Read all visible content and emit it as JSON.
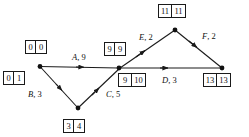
{
  "diagram": {
    "type": "activity-on-arrow-network",
    "nodes": [
      {
        "id": "start",
        "x": 40,
        "y": 66,
        "earliest": "0",
        "latest": "0",
        "box2_earliest": "0",
        "box2_latest": "1"
      },
      {
        "id": "bottom",
        "x": 78,
        "y": 108,
        "earliest": "3",
        "latest": "4"
      },
      {
        "id": "middle",
        "x": 119,
        "y": 68,
        "earliest": "9",
        "latest": "9",
        "box2_earliest": "9",
        "box2_latest": "10"
      },
      {
        "id": "apex",
        "x": 175,
        "y": 30,
        "earliest": "11",
        "latest": "11"
      },
      {
        "id": "end",
        "x": 222,
        "y": 68,
        "earliest": "13",
        "latest": "13"
      }
    ],
    "boxes": [
      {
        "name": "box-start-top",
        "first": "0",
        "second": "0",
        "x": 25,
        "y": 40,
        "wide": false
      },
      {
        "name": "box-start-bottom",
        "first": "0",
        "second": "1",
        "x": 3,
        "y": 71,
        "wide": false
      },
      {
        "name": "box-bottom",
        "first": "3",
        "second": "4",
        "x": 63,
        "y": 119,
        "wide": false
      },
      {
        "name": "box-middle-top",
        "first": "9",
        "second": "9",
        "x": 104,
        "y": 42,
        "wide": false
      },
      {
        "name": "box-middle-bottom",
        "first": "9",
        "second": "10",
        "x": 118,
        "y": 73,
        "wide": true
      },
      {
        "name": "box-apex",
        "first": "11",
        "second": "11",
        "x": 158,
        "y": 4,
        "wide": true
      },
      {
        "name": "box-end",
        "first": "13",
        "second": "13",
        "x": 203,
        "y": 73,
        "wide": true
      }
    ],
    "edges": [
      {
        "name": "edge-a",
        "id": "A",
        "duration": "9",
        "from": "start",
        "to": "middle",
        "label_x": 72,
        "label_y": 53
      },
      {
        "name": "edge-b",
        "id": "B",
        "duration": "3",
        "from": "start",
        "to": "bottom",
        "label_x": 28,
        "label_y": 90
      },
      {
        "name": "edge-c",
        "id": "C",
        "duration": "5",
        "from": "bottom",
        "to": "middle",
        "label_x": 106,
        "label_y": 90
      },
      {
        "name": "edge-e",
        "id": "E",
        "duration": "2",
        "from": "middle",
        "to": "apex",
        "label_x": 139,
        "label_y": 33
      },
      {
        "name": "edge-d",
        "id": "D",
        "duration": "3",
        "from": "middle",
        "to": "end",
        "label_x": 162,
        "label_y": 76
      },
      {
        "name": "edge-f",
        "id": "F",
        "duration": "2",
        "from": "apex",
        "to": "end",
        "label_x": 202,
        "label_y": 32
      }
    ],
    "colors": {
      "line": "#1a1a1a",
      "text": "#111111",
      "background": "#ffffff"
    }
  }
}
